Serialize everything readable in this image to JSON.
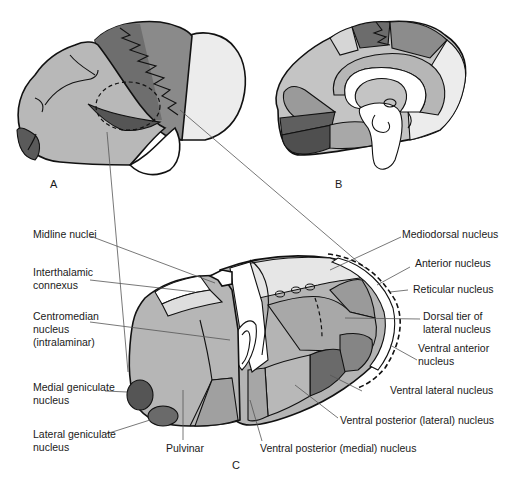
{
  "figure": {
    "panels": {
      "a": "A",
      "b": "B",
      "c": "C"
    },
    "labels": {
      "midline_nuclei": "Midline nuclei",
      "interthalamic_1": "Interthalamic",
      "interthalamic_2": "connexus",
      "centromedian_1": "Centromedian",
      "centromedian_2": "nucleus",
      "centromedian_3": "(intralaminar)",
      "medial_geniculate_1": "Medial geniculate",
      "medial_geniculate_2": "nucleus",
      "lateral_geniculate_1": "Lateral geniculate",
      "lateral_geniculate_2": "nucleus",
      "pulvinar": "Pulvinar",
      "mediodorsal": "Mediodorsal nucleus",
      "anterior": "Anterior nucleus",
      "reticular": "Reticular nucleus",
      "dorsal_tier_1": "Dorsal tier of",
      "dorsal_tier_2": "lateral nucleus",
      "ventral_anterior_1": "Ventral anterior",
      "ventral_anterior_2": "nucleus",
      "ventral_lateral": "Ventral lateral nucleus",
      "vpl": "Ventral posterior (lateral) nucleus",
      "vpm": "Ventral posterior (medial) nucleus"
    },
    "shades": {
      "light": "#e9e9e9",
      "mid_light": "#c8c8c8",
      "mid": "#b0b0b0",
      "mid_dark": "#8c8c8c",
      "dark": "#6a6a6a",
      "darkest": "#4a4a4a",
      "white": "#ffffff"
    }
  }
}
